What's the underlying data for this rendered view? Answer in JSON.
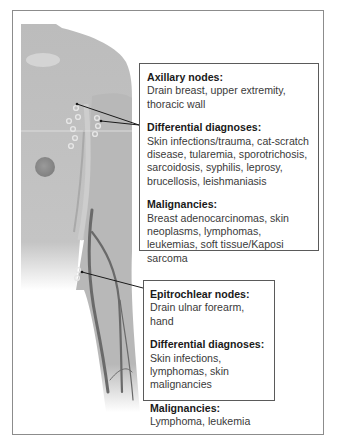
{
  "diagram": {
    "colors": {
      "skin": "#b9b9b9",
      "skin_light": "#cfcfcf",
      "vein": "#6e6e6e",
      "frame": "#8c8c8c",
      "callout_border": "#5a5a5a",
      "text": "#3a3a3a",
      "heading": "#1a1a1a"
    },
    "callouts": [
      {
        "id": "axillary",
        "sections": [
          {
            "title": "Axillary nodes:",
            "body": "Drain breast, upper extremity, thoracic wall"
          },
          {
            "title": "Differential diagnoses:",
            "body": "Skin infections/trauma, cat-scratch disease, tularemia, sporotrichosis, sarcoidosis, syphilis, leprosy, brucellosis, leishmaniasis"
          },
          {
            "title": "Malignancies:",
            "body": "Breast adenocarcinomas, skin neoplasms, lymphomas, leukemias, soft tissue/Kaposi sarcoma"
          }
        ]
      },
      {
        "id": "epitrochlear",
        "sections": [
          {
            "title": "Epitrochlear nodes:",
            "body": "Drain ulnar forearm, hand"
          },
          {
            "title": "Differential diagnoses:",
            "body": "Skin infections, lymphomas, skin malignancies"
          },
          {
            "title": "Malignancies:",
            "body": "Lymphoma, leukemia"
          }
        ]
      }
    ]
  }
}
